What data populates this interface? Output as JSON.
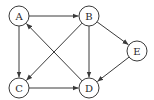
{
  "diagram": {
    "type": "directed-graph",
    "colors": {
      "stroke": "#3a3a3a",
      "fill": "#ffffff",
      "text": "#2a2a2a"
    },
    "node_radius": 10,
    "nodes": [
      {
        "id": "A",
        "label": "A",
        "x": 19,
        "y": 16
      },
      {
        "id": "B",
        "label": "B",
        "x": 89,
        "y": 16
      },
      {
        "id": "E",
        "label": "E",
        "x": 137,
        "y": 51
      },
      {
        "id": "C",
        "label": "C",
        "x": 19,
        "y": 88
      },
      {
        "id": "D",
        "label": "D",
        "x": 89,
        "y": 88
      }
    ],
    "edges": [
      {
        "from": "A",
        "to": "B"
      },
      {
        "from": "A",
        "to": "C"
      },
      {
        "from": "B",
        "to": "C"
      },
      {
        "from": "B",
        "to": "D"
      },
      {
        "from": "B",
        "to": "E"
      },
      {
        "from": "C",
        "to": "D"
      },
      {
        "from": "D",
        "to": "A"
      },
      {
        "from": "E",
        "to": "D"
      }
    ]
  }
}
